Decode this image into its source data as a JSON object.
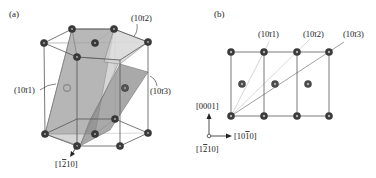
{
  "figure": {
    "panel_a": {
      "label": "(a)",
      "planes": [
        {
          "id": "p1011",
          "label": "(10ī1)",
          "h": "1",
          "k": "0",
          "i": "1",
          "l": "1"
        },
        {
          "id": "p1012",
          "label": "(10ī2)",
          "h": "1",
          "k": "0",
          "i": "1",
          "l": "2"
        },
        {
          "id": "p1013",
          "label": "(10ī3)",
          "h": "1",
          "k": "0",
          "i": "1",
          "l": "3"
        }
      ],
      "direction": {
        "label": "[1ħ0]",
        "pre": "[1",
        "bar": "2",
        "post": "10]"
      }
    },
    "panel_b": {
      "label": "(b)",
      "planes": [
        {
          "id": "p1011",
          "label": "(10ī1)"
        },
        {
          "id": "p1012",
          "label": "(10ī2)"
        },
        {
          "id": "p1013",
          "label": "(10ī3)"
        }
      ],
      "axes": {
        "vertical": {
          "label": "[0001]"
        },
        "horizontal": {
          "pre": "[10",
          "bar": "1",
          "post": "0]"
        },
        "out_of_plane": {
          "pre": "[1",
          "bar": "2",
          "post": "10]"
        }
      }
    },
    "colors": {
      "atom": "#3a3a3a",
      "atom_center": "#9a9a9a",
      "edge": "#555555",
      "plane_1011": "#9c9c9c",
      "plane_1012": "#c8c8c8",
      "plane_1013": "#8a8a8a",
      "trace_light": "#c8c8c8",
      "trace_mid": "#a8a8a8",
      "trace_dark": "#777777"
    }
  }
}
